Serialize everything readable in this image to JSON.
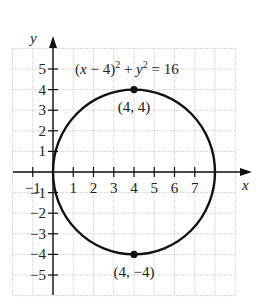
{
  "chart_data": {
    "type": "line",
    "title": "",
    "xlabel": "x",
    "ylabel": "y",
    "xlim": [
      -2,
      9
    ],
    "ylim": [
      -6,
      6
    ],
    "grid": true,
    "x_ticks": [
      -1,
      1,
      2,
      3,
      4,
      5,
      6,
      7
    ],
    "x_tick_labels": [
      "−1",
      "1",
      "2",
      "3",
      "4",
      "5",
      "6",
      "7"
    ],
    "y_ticks": [
      5,
      4,
      3,
      2,
      1,
      -1,
      -2,
      -3,
      -4,
      -5
    ],
    "y_tick_labels": [
      "5",
      "4",
      "3",
      "2",
      "1",
      "−1",
      "−2",
      "−3",
      "−4",
      "−5"
    ],
    "series": [
      {
        "name": "(x − 4)² + y² = 16",
        "kind": "circle",
        "center": [
          4,
          0
        ],
        "radius": 4
      }
    ],
    "points": [
      {
        "x": 4,
        "y": 4,
        "label": "(4, 4)"
      },
      {
        "x": 4,
        "y": -4,
        "label": "(4, −4)"
      }
    ],
    "annotations": [
      {
        "text": "(x − 4)² + y² = 16",
        "x": 4,
        "y": 5
      }
    ]
  },
  "labels": {
    "x_axis": "x",
    "y_axis": "y",
    "equation": {
      "part1": "(",
      "x": "x",
      "part2": " − 4)",
      "sup1": "2",
      "part3": " + ",
      "y": "y",
      "sup2": "2",
      "part4": " = 16"
    },
    "point_top": "(4, 4)",
    "point_bottom": "(4, −4)"
  }
}
